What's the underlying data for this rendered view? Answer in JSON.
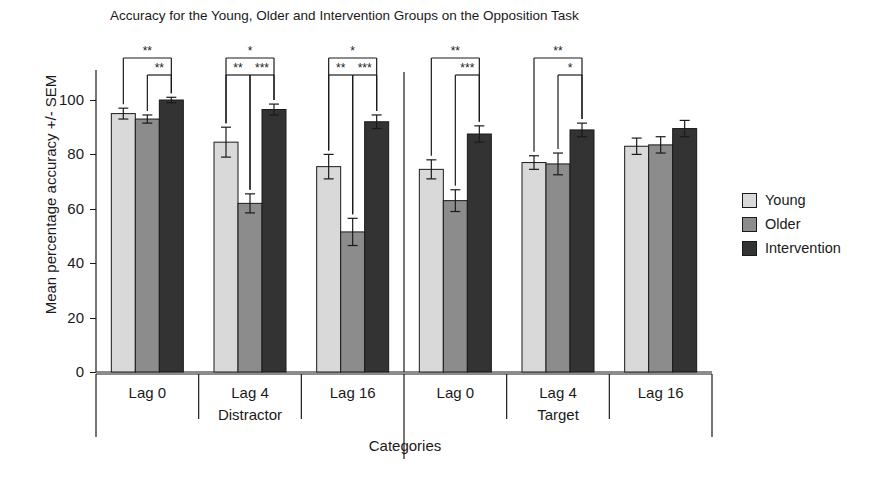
{
  "chart_data": {
    "type": "bar",
    "title": "Accuracy for the Young, Older and Intervention Groups on the Opposition Task",
    "xlabel": "Categories",
    "ylabel": "Mean percentage accuracy +/- SEM",
    "ylim": [
      0,
      105
    ],
    "yticks": [
      0,
      20,
      40,
      60,
      80,
      100
    ],
    "grid": false,
    "legend_position": "right",
    "categories": [
      "Lag 0",
      "Lag 4",
      "Lag 16",
      "Lag 0",
      "Lag 4",
      "Lag 16"
    ],
    "panels": [
      {
        "label": "Distractor",
        "categories": [
          "Lag 0",
          "Lag 4",
          "Lag 16"
        ]
      },
      {
        "label": "Target",
        "categories": [
          "Lag 0",
          "Lag 4",
          "Lag 16"
        ]
      }
    ],
    "series": [
      {
        "name": "Young",
        "color": "#d9d9d9",
        "values": [
          95,
          84.5,
          75.5,
          74.5,
          77,
          83
        ],
        "errors": [
          2,
          5.5,
          4.5,
          3.5,
          2.5,
          3
        ]
      },
      {
        "name": "Older",
        "color": "#8c8c8c",
        "values": [
          93,
          62,
          51.5,
          63,
          76.5,
          83.5
        ],
        "errors": [
          1.5,
          3.5,
          5,
          4,
          4,
          3
        ]
      },
      {
        "name": "Intervention",
        "color": "#333333",
        "values": [
          100,
          96.5,
          92,
          87.5,
          89,
          89.5
        ],
        "errors": [
          1,
          2,
          2.5,
          3,
          2.5,
          3
        ]
      }
    ],
    "significance": [
      {
        "group": 0,
        "from": "Young",
        "to": "Intervention",
        "stars": "**",
        "level": 1
      },
      {
        "group": 0,
        "from": "Older",
        "to": "Intervention",
        "stars": "**",
        "level": 2
      },
      {
        "group": 1,
        "from": "Young",
        "to": "Intervention",
        "stars": "*",
        "level": 1
      },
      {
        "group": 1,
        "from": "Young",
        "to": "Older",
        "stars": "**",
        "level": 2
      },
      {
        "group": 1,
        "from": "Older",
        "to": "Intervention",
        "stars": "***",
        "level": 2
      },
      {
        "group": 2,
        "from": "Young",
        "to": "Intervention",
        "stars": "*",
        "level": 1
      },
      {
        "group": 2,
        "from": "Young",
        "to": "Older",
        "stars": "**",
        "level": 2
      },
      {
        "group": 2,
        "from": "Older",
        "to": "Intervention",
        "stars": "***",
        "level": 2
      },
      {
        "group": 3,
        "from": "Young",
        "to": "Intervention",
        "stars": "**",
        "level": 1
      },
      {
        "group": 3,
        "from": "Older",
        "to": "Intervention",
        "stars": "***",
        "level": 2
      },
      {
        "group": 4,
        "from": "Young",
        "to": "Intervention",
        "stars": "**",
        "level": 1
      },
      {
        "group": 4,
        "from": "Older",
        "to": "Intervention",
        "stars": "*",
        "level": 2
      }
    ]
  },
  "legend": {
    "items": [
      {
        "label": "Young",
        "color": "#d9d9d9"
      },
      {
        "label": "Older",
        "color": "#8c8c8c"
      },
      {
        "label": "Intervention",
        "color": "#333333"
      }
    ]
  }
}
